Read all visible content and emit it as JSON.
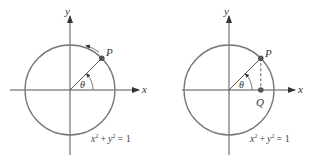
{
  "figures": [
    {
      "id": "left",
      "axis_x_label": "x",
      "axis_y_label": "y",
      "point_label": "P",
      "angle_label": "θ",
      "equation": {
        "a": "x",
        "b": "y",
        "exp": "2",
        "plus": "+",
        "eq": "= 1"
      },
      "angle_deg": 45,
      "has_motion_arrow": true
    },
    {
      "id": "right",
      "axis_x_label": "x",
      "axis_y_label": "y",
      "point_label": "P",
      "foot_label": "Q",
      "angle_label": "θ",
      "equation": {
        "a": "x",
        "b": "y",
        "exp": "2",
        "plus": "+",
        "eq": "= 1"
      },
      "angle_deg": 45,
      "has_dashed_projection": true
    }
  ],
  "colors": {
    "circle": "#777777",
    "axes": "#444444",
    "point": "#555555"
  }
}
